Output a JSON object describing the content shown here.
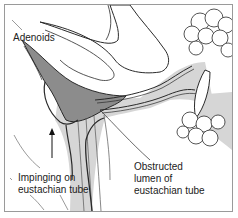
{
  "diagram": {
    "type": "medical-illustration",
    "colors": {
      "frame": "#9a9a9a",
      "adenoid_fill": "#8c8c8c",
      "tissue_fill": "#d6d6d6",
      "outline": "#2a2a2a",
      "background": "#ffffff"
    },
    "labels": {
      "adenoids": "Adenoids",
      "impinging": [
        "Impinging on",
        "eustachian tube"
      ],
      "obstructed": [
        "Obstructed",
        "lumen of",
        "eustachian tube"
      ]
    }
  }
}
